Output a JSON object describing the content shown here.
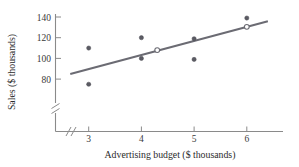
{
  "chart_data": {
    "type": "scatter",
    "title": "",
    "subtitle": "",
    "xlabel": "Advertising budget ($ thousands)",
    "ylabel": "Sales ($ thousands)",
    "xlim": [
      2.55,
      6.5
    ],
    "ylim": [
      76,
      144
    ],
    "grid": false,
    "legend": null,
    "x_ticks": [
      3,
      4,
      5,
      6
    ],
    "x_tick_labels": [
      "3",
      "4",
      "5",
      "6"
    ],
    "y_ticks": [
      80,
      100,
      120,
      140
    ],
    "y_tick_labels": [
      "80",
      "100",
      "120",
      "140"
    ],
    "x_axis_break": true,
    "y_axis_break": true,
    "points": [
      {
        "x": 3,
        "y": 110,
        "marker": "filled"
      },
      {
        "x": 3,
        "y": 75,
        "marker": "filled"
      },
      {
        "x": 4,
        "y": 120,
        "marker": "filled"
      },
      {
        "x": 4,
        "y": 100,
        "marker": "filled"
      },
      {
        "x": 5,
        "y": 119,
        "marker": "filled"
      },
      {
        "x": 5,
        "y": 99,
        "marker": "filled"
      },
      {
        "x": 6,
        "y": 139,
        "marker": "filled"
      },
      {
        "x": 4.3,
        "y": 108,
        "marker": "open"
      },
      {
        "x": 6.0,
        "y": 130.5,
        "marker": "open"
      }
    ],
    "trend_line": {
      "type": "line",
      "x_start": 2.65,
      "y_start": 85,
      "x_end": 6.4,
      "y_end": 136,
      "slope": 13.6,
      "intercept": 48.9,
      "color": "#6b6b73"
    },
    "colors": {
      "point_fill": "#5b5b63",
      "open_point_fill": "#ffffff",
      "line": "#6b6b73",
      "axis": "#8a8a8a",
      "text": "#2b2b2b",
      "background": "#ffffff"
    }
  }
}
